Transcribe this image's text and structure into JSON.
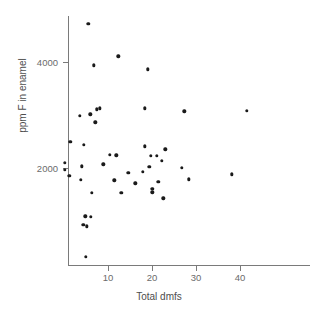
{
  "chart_data": {
    "type": "scatter",
    "title": "",
    "xlabel": "Total dmfs",
    "ylabel": "ppm F in enamel",
    "xlim": [
      0,
      56
    ],
    "ylim": [
      0,
      5100
    ],
    "grid": false,
    "legend": null,
    "xticks": [
      10,
      20,
      30,
      40
    ],
    "xtick_labels": [
      "10",
      "20",
      "30",
      "40"
    ],
    "yticks": [
      2000,
      4000
    ],
    "ytick_labels": [
      "2000",
      "4000"
    ],
    "marker": "filled-circle",
    "marker_color": "#1a1a1a",
    "axis_color": "#7a7a7a",
    "points": [
      {
        "x": 5.5,
        "y": 4720
      },
      {
        "x": 12.3,
        "y": 4110
      },
      {
        "x": 6.8,
        "y": 3940
      },
      {
        "x": 19.1,
        "y": 3860
      },
      {
        "x": 18.3,
        "y": 3130
      },
      {
        "x": 27.3,
        "y": 3070
      },
      {
        "x": 41.6,
        "y": 3080
      },
      {
        "x": 7.5,
        "y": 3110
      },
      {
        "x": 8.2,
        "y": 3130
      },
      {
        "x": 6.0,
        "y": 3010
      },
      {
        "x": 3.6,
        "y": 2980
      },
      {
        "x": 7.1,
        "y": 2860
      },
      {
        "x": 1.4,
        "y": 2490
      },
      {
        "x": 4.5,
        "y": 2440
      },
      {
        "x": 18.4,
        "y": 2410
      },
      {
        "x": 23.0,
        "y": 2350
      },
      {
        "x": 10.4,
        "y": 2250
      },
      {
        "x": 11.9,
        "y": 2240
      },
      {
        "x": 19.7,
        "y": 2230
      },
      {
        "x": 21.1,
        "y": 2230
      },
      {
        "x": 22.2,
        "y": 2140
      },
      {
        "x": 19.4,
        "y": 2020
      },
      {
        "x": 26.8,
        "y": 2000
      },
      {
        "x": 8.9,
        "y": 2070
      },
      {
        "x": 4.1,
        "y": 2030
      },
      {
        "x": 0.2,
        "y": 2100
      },
      {
        "x": 0.2,
        "y": 1970
      },
      {
        "x": 17.9,
        "y": 1930
      },
      {
        "x": 14.6,
        "y": 1910
      },
      {
        "x": 1.2,
        "y": 1850
      },
      {
        "x": 38.2,
        "y": 1880
      },
      {
        "x": 28.4,
        "y": 1790
      },
      {
        "x": 3.8,
        "y": 1780
      },
      {
        "x": 11.4,
        "y": 1770
      },
      {
        "x": 21.4,
        "y": 1740
      },
      {
        "x": 16.2,
        "y": 1710
      },
      {
        "x": 20.1,
        "y": 1610
      },
      {
        "x": 20.1,
        "y": 1540
      },
      {
        "x": 13.0,
        "y": 1530
      },
      {
        "x": 6.3,
        "y": 1530
      },
      {
        "x": 22.6,
        "y": 1430
      },
      {
        "x": 4.8,
        "y": 1090
      },
      {
        "x": 6.1,
        "y": 1080
      },
      {
        "x": 4.4,
        "y": 930
      },
      {
        "x": 5.2,
        "y": 900
      },
      {
        "x": 4.9,
        "y": 330
      }
    ]
  }
}
